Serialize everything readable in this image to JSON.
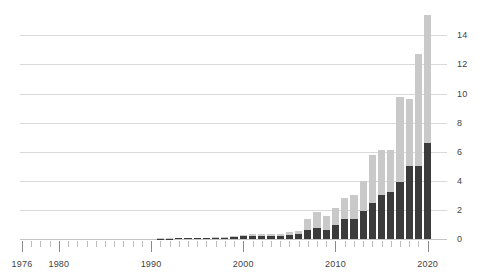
{
  "chart_data": {
    "type": "bar",
    "stacked": true,
    "title": "",
    "subtitle": "",
    "xlabel": "",
    "ylabel": "",
    "xlim": [
      1975,
      2021
    ],
    "ylim": [
      0,
      15.6
    ],
    "grid": true,
    "legend_position": "none",
    "y_ticks": [
      0,
      2,
      4,
      6,
      8,
      10,
      12,
      14
    ],
    "y_tick_labels": [
      "0",
      "2",
      "4",
      "6",
      "8",
      "10",
      "12",
      "14"
    ],
    "y_axis_side": "right",
    "x_ticks_labeled": [
      1976,
      1980,
      1990,
      2000,
      2010,
      2020
    ],
    "x_tick_labels": [
      "1976",
      "1980",
      "1990",
      "2000",
      "2010",
      "2020"
    ],
    "x_tick_minor_every": 1,
    "categories": [
      "1976",
      "1977",
      "1978",
      "1979",
      "1980",
      "1981",
      "1982",
      "1983",
      "1984",
      "1985",
      "1986",
      "1987",
      "1988",
      "1989",
      "1990",
      "1991",
      "1992",
      "1993",
      "1994",
      "1995",
      "1996",
      "1997",
      "1998",
      "1999",
      "2000",
      "2001",
      "2002",
      "2003",
      "2004",
      "2005",
      "2006",
      "2007",
      "2008",
      "2009",
      "2010",
      "2011",
      "2012",
      "2013",
      "2014",
      "2015",
      "2016",
      "2017",
      "2018",
      "2019",
      "2020"
    ],
    "series": [
      {
        "name": "dark-segment",
        "color": "#3b3b3b",
        "values": [
          0,
          0,
          0,
          0,
          0,
          0,
          0,
          0,
          0,
          0,
          0,
          0,
          0,
          0,
          0,
          0.02,
          0.03,
          0.04,
          0.04,
          0.05,
          0.06,
          0.07,
          0.09,
          0.12,
          0.18,
          0.22,
          0.22,
          0.21,
          0.2,
          0.3,
          0.34,
          0.6,
          0.78,
          0.62,
          0.95,
          1.4,
          1.4,
          1.95,
          2.5,
          3.05,
          3.25,
          3.95,
          5.05,
          5.05,
          6.6
        ]
      },
      {
        "name": "light-segment",
        "color": "#c9c9c9",
        "values": [
          0,
          0,
          0,
          0,
          0,
          0,
          0,
          0,
          0,
          0,
          0,
          0,
          0,
          0,
          0,
          0.02,
          0.02,
          0.02,
          0.03,
          0.03,
          0.04,
          0.05,
          0.06,
          0.08,
          0.1,
          0.12,
          0.11,
          0.12,
          0.13,
          0.15,
          0.2,
          0.75,
          1.1,
          0.98,
          1.2,
          1.4,
          1.65,
          2.05,
          3.3,
          3.05,
          2.85,
          5.8,
          4.6,
          7.65,
          8.8
        ]
      }
    ],
    "totals": [
      0,
      0,
      0,
      0,
      0,
      0,
      0,
      0,
      0,
      0,
      0,
      0,
      0,
      0,
      0,
      0.04,
      0.05,
      0.06,
      0.07,
      0.08,
      0.1,
      0.12,
      0.15,
      0.2,
      0.28,
      0.34,
      0.33,
      0.33,
      0.33,
      0.45,
      0.54,
      1.35,
      1.88,
      1.6,
      2.15,
      2.8,
      3.05,
      4.0,
      5.8,
      6.1,
      6.1,
      9.75,
      9.65,
      12.7,
      15.4
    ]
  },
  "colors": {
    "dark": "#3b3b3b",
    "light": "#c9c9c9",
    "gridline": "#d9d9d9",
    "tick": "#bdbdbd",
    "text": "#3f3f3f",
    "background": "#ffffff"
  }
}
